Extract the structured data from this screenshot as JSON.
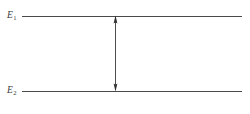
{
  "figure": {
    "background_color": "#ffffff",
    "line_color": "#4a4a4a",
    "text_color": "#3a3a3a",
    "arrow_color": "#3a3a3a"
  },
  "levels": [
    {
      "id": "upper",
      "label_base": "E",
      "label_subscript": "1",
      "label_full": "E1",
      "line_y": 16,
      "line_x_start": 22,
      "line_x_end": 242
    },
    {
      "id": "lower",
      "label_base": "E",
      "label_subscript": "2",
      "label_full": "E2",
      "line_y": 91,
      "line_x_start": 22,
      "line_x_end": 242
    }
  ],
  "arrow": {
    "name": "double-headed-transition-arrow",
    "orientation": "vertical",
    "heads": "both",
    "x": 115,
    "y_top": 16,
    "y_bottom": 91
  },
  "chart_data": {
    "type": "diagram",
    "categories": [
      "E1",
      "E2"
    ],
    "values": [
      16,
      91
    ],
    "xlabel": "",
    "ylabel": "Energy",
    "annotations": [
      "double-headed arrow between E1 and E2"
    ]
  }
}
